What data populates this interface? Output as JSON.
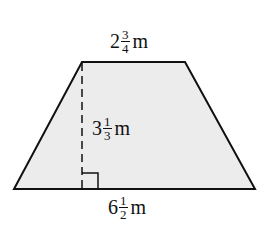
{
  "figure": {
    "shape": "trapezoid",
    "fill_color": "#ececec",
    "stroke_color": "#111111",
    "top_base": {
      "whole": "2",
      "numerator": "3",
      "denominator": "4",
      "unit": "m"
    },
    "height": {
      "whole": "3",
      "numerator": "1",
      "denominator": "3",
      "unit": "m"
    },
    "bottom_base": {
      "whole": "6",
      "numerator": "1",
      "denominator": "2",
      "unit": "m"
    },
    "right_angle_marker": true,
    "height_line_style": "dashed"
  }
}
